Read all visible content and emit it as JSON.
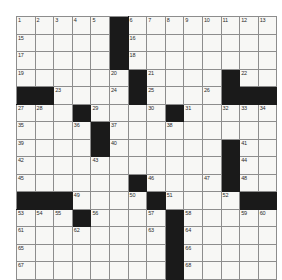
{
  "puzzle": {
    "title": "Crossword Grid",
    "rows": 15,
    "columns": 14,
    "colors": {
      "block": "#1a1a1a",
      "cell": "#f7f7f5",
      "grid_line": "#8d8d8d",
      "number": "#2b2b2b",
      "page_background": "#ffffff"
    },
    "grid": [
      [
        {
          "n": "1"
        },
        {
          "n": "2"
        },
        {
          "n": "3"
        },
        {
          "n": "4"
        },
        {
          "n": "5"
        },
        {
          "block": true
        },
        {
          "n": "6"
        },
        {
          "n": "7"
        },
        {
          "n": "8"
        },
        {
          "n": "9"
        },
        {
          "n": "10"
        },
        {
          "n": "11"
        },
        {
          "n": "12"
        },
        {
          "n": "13"
        }
      ],
      [
        {
          "n": "15"
        },
        {},
        {},
        {},
        {},
        {
          "block": true
        },
        {
          "n": "16"
        },
        {},
        {},
        {},
        {},
        {},
        {},
        {}
      ],
      [
        {
          "n": "17"
        },
        {},
        {},
        {},
        {},
        {
          "block": true
        },
        {
          "n": "18"
        },
        {},
        {},
        {},
        {},
        {},
        {},
        {}
      ],
      [
        {
          "n": "19"
        },
        {},
        {},
        {},
        {},
        {
          "n": "20"
        },
        {
          "block": true
        },
        {
          "n": "21"
        },
        {},
        {},
        {},
        {
          "block": true
        },
        {
          "n": "22"
        },
        {}
      ],
      [
        {
          "block": true
        },
        {
          "block": true
        },
        {
          "n": "23"
        },
        {},
        {},
        {
          "n": "24"
        },
        {
          "block": true
        },
        {
          "n": "25"
        },
        {},
        {},
        {
          "n": "26"
        },
        {
          "block": true
        },
        {
          "block": true
        },
        {
          "block": true
        }
      ],
      [
        {
          "n": "27"
        },
        {
          "n": "28"
        },
        {},
        {
          "block": true
        },
        {
          "n": "29"
        },
        {},
        {},
        {
          "n": "30"
        },
        {
          "block": true
        },
        {
          "n": "31"
        },
        {},
        {
          "n": "32"
        },
        {
          "n": "33"
        },
        {
          "n": "34"
        }
      ],
      [
        {
          "n": "35"
        },
        {},
        {},
        {
          "n": "36"
        },
        {
          "block": true
        },
        {
          "n": "37"
        },
        {},
        {},
        {
          "n": "38"
        },
        {},
        {},
        {},
        {},
        {}
      ],
      [
        {
          "n": "39"
        },
        {},
        {},
        {},
        {
          "block": true
        },
        {
          "n": "40"
        },
        {},
        {},
        {},
        {},
        {},
        {
          "block": true
        },
        {
          "n": "41"
        },
        {}
      ],
      [
        {
          "n": "42"
        },
        {},
        {},
        {},
        {
          "n": "43"
        },
        {},
        {},
        {},
        {},
        {},
        {},
        {
          "block": true
        },
        {
          "n": "44"
        },
        {}
      ],
      [
        {
          "n": "45"
        },
        {},
        {},
        {},
        {},
        {},
        {
          "block": true
        },
        {
          "n": "46"
        },
        {},
        {},
        {
          "n": "47"
        },
        {
          "block": true
        },
        {
          "n": "48"
        },
        {}
      ],
      [
        {
          "block": true
        },
        {
          "block": true
        },
        {
          "block": true
        },
        {
          "n": "49"
        },
        {},
        {},
        {
          "n": "50"
        },
        {
          "block": true
        },
        {
          "n": "51"
        },
        {},
        {},
        {
          "n": "52"
        },
        {
          "block": true
        },
        {
          "block": true
        }
      ],
      [
        {
          "n": "53"
        },
        {
          "n": "54"
        },
        {
          "n": "55"
        },
        {
          "block": true
        },
        {
          "n": "56"
        },
        {},
        {},
        {
          "n": "57"
        },
        {
          "block": true
        },
        {
          "n": "58"
        },
        {},
        {},
        {
          "n": "59"
        },
        {
          "n": "60"
        }
      ],
      [
        {
          "n": "61"
        },
        {},
        {},
        {
          "n": "62"
        },
        {},
        {},
        {},
        {
          "n": "63"
        },
        {
          "block": true
        },
        {
          "n": "64"
        },
        {},
        {},
        {},
        {}
      ],
      [
        {
          "n": "65"
        },
        {},
        {},
        {},
        {},
        {},
        {},
        {},
        {
          "block": true
        },
        {
          "n": "66"
        },
        {},
        {},
        {},
        {}
      ],
      [
        {
          "n": "67"
        },
        {},
        {},
        {},
        {},
        {},
        {},
        {},
        {
          "block": true
        },
        {
          "n": "68"
        },
        {},
        {},
        {},
        {}
      ]
    ]
  }
}
